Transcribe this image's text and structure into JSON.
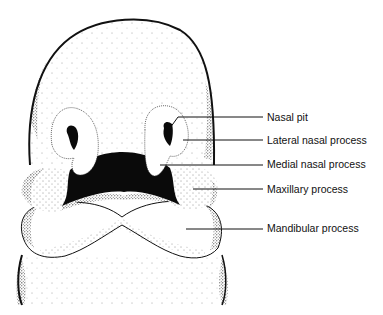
{
  "diagram": {
    "labels": [
      {
        "id": "nasal-pit",
        "text": "Nasal pit",
        "x": 267,
        "y": 111
      },
      {
        "id": "lateral-nasal-process",
        "text": "Lateral nasal process",
        "x": 267,
        "y": 134
      },
      {
        "id": "medial-nasal-process",
        "text": "Medial nasal process",
        "x": 267,
        "y": 158
      },
      {
        "id": "maxillary-process",
        "text": "Maxillary process",
        "x": 267,
        "y": 183
      },
      {
        "id": "mandibular-process",
        "text": "Mandibular process",
        "x": 267,
        "y": 222
      }
    ],
    "colors": {
      "ink": "#111111",
      "background": "#ffffff"
    }
  }
}
